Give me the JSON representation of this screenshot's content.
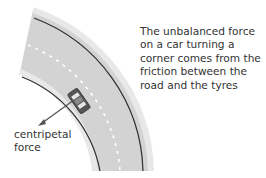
{
  "caption": "The unbalanced force on a car turning a corner comes from the friction between the road and the tyres",
  "force_label_line1": "centripetal",
  "force_label_line2": "force",
  "colors": {
    "road": "#d6d6d6",
    "road_edge": "#ebebeb",
    "edge_line": "#2e2e2e",
    "centre_dash": "#ffffff",
    "car_body": "#555555",
    "car_window": "#8a8a8a",
    "arrow": "#555555",
    "text": "#333333"
  }
}
